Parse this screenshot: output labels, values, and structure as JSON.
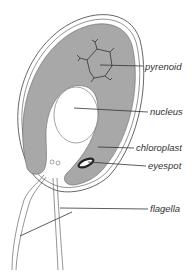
{
  "diagram": {
    "title": "",
    "colors": {
      "background": "#ffffff",
      "chloroplast": "#a8a8a8",
      "outline": "#555555",
      "label_line": "#333333",
      "eyespot": "#222222",
      "text": "#333333"
    },
    "labels": [
      {
        "id": "pyrenoid",
        "text": "pyrenoid"
      },
      {
        "id": "nucleus",
        "text": "nucleus"
      },
      {
        "id": "chloroplast",
        "text": "chloroplast"
      },
      {
        "id": "eyespot",
        "text": "eyespot"
      },
      {
        "id": "flagella",
        "text": "flagella"
      }
    ]
  }
}
